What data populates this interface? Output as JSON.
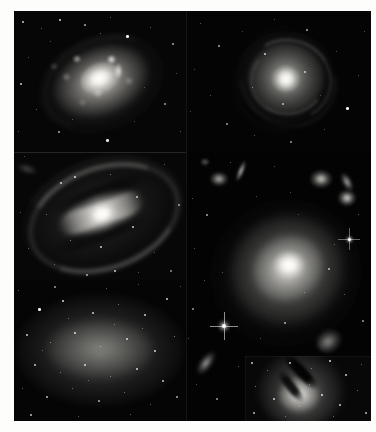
{
  "figure": {
    "kind": "astronomical-image-montage",
    "colour_mode": "grayscale",
    "background_colour": "#fdfdfc",
    "plate_colour": "#000000",
    "panel_count": 6,
    "title": "",
    "caption": ""
  },
  "panels": [
    {
      "id": "top-left",
      "name": "clumpy-starburst-spiral",
      "object_type": "spiral galaxy",
      "description": "bright knotty spiral / starburst galaxy, inclined, with many resolved HII-region clumps",
      "label": ""
    },
    {
      "id": "top-right",
      "name": "face-on-spiral",
      "object_type": "spiral galaxy",
      "description": "small face-on grand-design spiral with flocculent arms",
      "label": ""
    },
    {
      "id": "middle-left",
      "name": "barred-spiral",
      "object_type": "barred spiral galaxy",
      "description": "large barred spiral, prominent straight bar with two sweeping outer arms",
      "label": ""
    },
    {
      "id": "bottom-left",
      "name": "dwarf-irregular",
      "object_type": "dwarf irregular galaxy",
      "description": "diffuse dwarf irregular resolved into many individual stars",
      "label": ""
    },
    {
      "id": "right-column",
      "name": "elliptical-with-companions",
      "object_type": "elliptical galaxy field",
      "description": "large smooth elliptical galaxy with bright nucleus, surrounded by small background galaxies and a bright foreground star with diffraction spikes",
      "label": ""
    },
    {
      "id": "bottom-right-inset",
      "name": "dust-lane-galaxy",
      "object_type": "lenticular galaxy with dust lane",
      "description": "bright galaxy crossed by a dark diagonal dust lane, in a dense star field",
      "label": ""
    }
  ],
  "colors": {
    "page": "#fdfdfc",
    "sky": "#050505",
    "star": "#ffffff",
    "glow_warm": "#f2f0ea"
  }
}
